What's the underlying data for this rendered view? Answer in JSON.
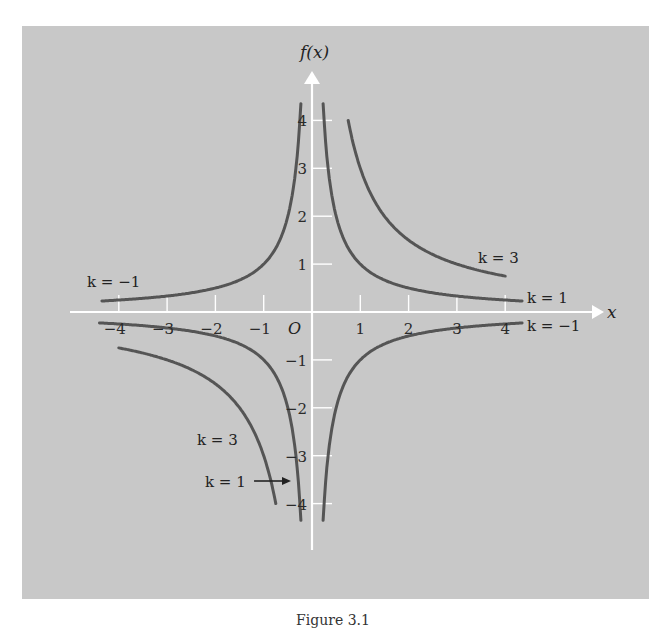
{
  "chart_data": {
    "type": "line",
    "title": "",
    "caption": "Figure 3.1",
    "xlabel": "x",
    "ylabel": "f(x)",
    "origin_label": "O",
    "xlim": [
      -4.4,
      4.4
    ],
    "ylim": [
      -4.4,
      4.4
    ],
    "x_ticks": [
      -4,
      -3,
      -2,
      -1,
      1,
      2,
      3,
      4
    ],
    "x_tick_labels": [
      "−4",
      "−3",
      "−2",
      "−1",
      "1",
      "2",
      "3",
      "4"
    ],
    "y_ticks": [
      -4,
      -3,
      -2,
      -1,
      1,
      2,
      3,
      4
    ],
    "y_tick_labels": [
      "−4",
      "−3",
      "−2",
      "−1",
      "1",
      "2",
      "3",
      "4"
    ],
    "grid": false,
    "function": "f(x) = k/x",
    "series": [
      {
        "name": "k = 1",
        "k": 1,
        "branches": [
          {
            "x_from": 0.23,
            "x_to": 4.35
          },
          {
            "x_from": -4.4,
            "x_to": -0.23
          }
        ]
      },
      {
        "name": "k = 3",
        "k": 3,
        "branches": [
          {
            "x_from": 0.75,
            "x_to": 4
          },
          {
            "x_from": -4,
            "x_to": -0.75
          }
        ]
      },
      {
        "name": "k = −1",
        "k": -1,
        "branches": [
          {
            "x_from": -4.35,
            "x_to": -0.23
          },
          {
            "x_from": 0.23,
            "x_to": 4.35
          }
        ]
      }
    ],
    "annotations": [
      {
        "text": "k = −1",
        "near": "upper-left branch"
      },
      {
        "text": "k = 3",
        "near": "upper-right branch (k=3)"
      },
      {
        "text": "k = 1",
        "near": "upper-right branch (k=1)"
      },
      {
        "text": "k = −1",
        "near": "lower-right branch"
      },
      {
        "text": "k = 3",
        "near": "lower-left branch (k=3)"
      },
      {
        "text": "k = 1",
        "near": "lower-left branch (k=1), with arrow"
      }
    ]
  },
  "labels": {
    "k_neg1_left": "k = −1",
    "k3_right": "k = 3",
    "k1_right": "k = 1",
    "k_neg1_right": "k = −1",
    "k3_left": "k = 3",
    "k1_left": "k = 1"
  },
  "colors": {
    "panel": "#c8c8c8",
    "axis": "#ffffff",
    "curve": "#555555"
  }
}
